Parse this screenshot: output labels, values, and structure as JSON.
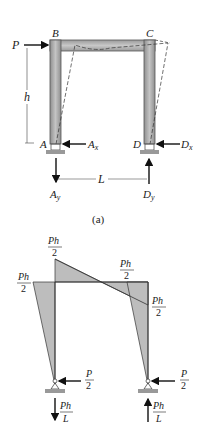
{
  "figure": {
    "part_a": {
      "caption": "(a)",
      "load_label": "P",
      "height_label": "h",
      "span_label": "L",
      "joints": {
        "B": "B",
        "C": "C",
        "A": "A",
        "D": "D"
      },
      "reactions": {
        "Ax": {
          "main": "A",
          "sub": "x"
        },
        "Dx": {
          "main": "D",
          "sub": "x"
        },
        "Ay": {
          "main": "A",
          "sub": "y"
        },
        "Dy": {
          "main": "D",
          "sub": "y"
        }
      }
    },
    "part_b": {
      "moment_labels": {
        "left_top": {
          "num": "Ph",
          "den": "2"
        },
        "left_side": {
          "num": "Ph",
          "den": "2"
        },
        "right_top": {
          "num": "Ph",
          "den": "2"
        },
        "right_side": {
          "num": "Ph",
          "den": "2"
        }
      },
      "left_support_horizontal": {
        "num": "P",
        "den": "2"
      },
      "right_support_horizontal": {
        "num": "P",
        "den": "2"
      },
      "left_support_vertical": {
        "num": "Ph",
        "den": "L"
      },
      "right_support_vertical": {
        "num": "Ph",
        "den": "L"
      }
    },
    "colors": {
      "member_fill": "#a8a8a8",
      "member_stroke": "#555555",
      "moment_fill": "#bdbdbd",
      "line": "#222222"
    }
  }
}
